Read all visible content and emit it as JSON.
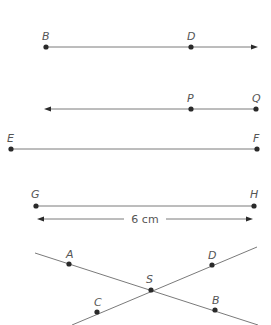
{
  "figures": {
    "ray_bd": {
      "points": [
        {
          "label": "B",
          "x": 46,
          "y": 47
        },
        {
          "label": "D",
          "x": 191,
          "y": 47
        }
      ],
      "type": "ray",
      "direction": "right"
    },
    "ray_qp": {
      "points": [
        {
          "label": "P",
          "x": 191,
          "y": 109
        },
        {
          "label": "Q",
          "x": 256,
          "y": 109
        }
      ],
      "type": "ray",
      "direction": "left"
    },
    "segment_ef": {
      "points": [
        {
          "label": "E",
          "x": 11,
          "y": 149
        },
        {
          "label": "F",
          "x": 257,
          "y": 149
        }
      ],
      "type": "segment"
    },
    "segment_gh": {
      "points": [
        {
          "label": "G",
          "x": 36,
          "y": 206
        },
        {
          "label": "H",
          "x": 254,
          "y": 206
        }
      ],
      "type": "segment",
      "dimension_label": "6 cm"
    },
    "intersecting_lines": {
      "points": [
        {
          "label": "A",
          "x": 69,
          "y": 264
        },
        {
          "label": "D",
          "x": 212,
          "y": 265
        },
        {
          "label": "S",
          "x": 151,
          "y": 290
        },
        {
          "label": "C",
          "x": 97,
          "y": 312
        },
        {
          "label": "B",
          "x": 215,
          "y": 310
        }
      ],
      "lines": [
        "AB",
        "CD"
      ],
      "intersection": "S"
    }
  },
  "colors": {
    "line": "#7a7a7a",
    "point": "#2a2a2a",
    "label": "#555555"
  }
}
